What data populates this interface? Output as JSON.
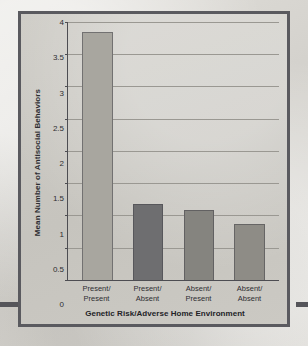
{
  "chart_data": {
    "type": "bar",
    "title": "",
    "xlabel": "Genetic Risk/Adverse Home Environment",
    "ylabel": "Mean Number of Antisocial Behaviors",
    "categories": [
      "Present/ Present",
      "Present/ Absent",
      "Absent/ Present",
      "Absent/ Absent"
    ],
    "category_lines": [
      {
        "line1": "Present/",
        "line2": "Present"
      },
      {
        "line1": "Present/",
        "line2": "Absent"
      },
      {
        "line1": "Absent/",
        "line2": "Present"
      },
      {
        "line1": "Absent/",
        "line2": "Absent"
      }
    ],
    "values": [
      3.85,
      1.17,
      1.08,
      0.87
    ],
    "bar_colors": [
      "#a8a69f",
      "#6e6e70",
      "#85847f",
      "#8e8c86"
    ],
    "ylim": [
      0,
      4
    ],
    "ytick_values": [
      0,
      0.5,
      1,
      1.5,
      2,
      2.5,
      3,
      3.5,
      4
    ],
    "ytick_labels": [
      "0",
      "0.5",
      "1",
      "1.5",
      "2",
      "2.5",
      "3",
      "3.5",
      "4"
    ],
    "grid": true,
    "legend": "none"
  },
  "figure": {
    "frame_color": "#5a5a5f",
    "plot_background": "#cbc9c3",
    "page_background": "#d9d7d2",
    "rule_color": "#55555a"
  }
}
